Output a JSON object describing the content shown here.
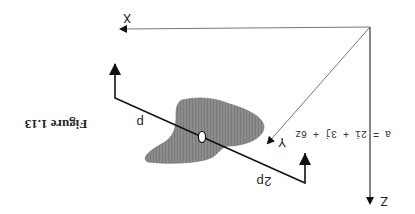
{
  "figure": {
    "caption": "Figure 1.13",
    "orientation": "rotated 180 degrees",
    "axes": {
      "x_label": "X",
      "y_label": "Y",
      "z_label": "Z"
    },
    "equation": "a = 2i + 3j + 6z",
    "line_labels": {
      "near": "p",
      "far": "2p"
    },
    "colors": {
      "blob": "#8a8a8a",
      "lines": "#111111",
      "axis_thin": "#777777",
      "background": "#ffffff"
    }
  }
}
